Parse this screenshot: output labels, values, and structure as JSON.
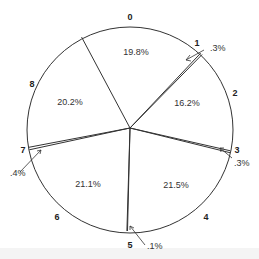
{
  "chart_data": {
    "type": "pie",
    "title": "",
    "categories": [
      "0",
      "1",
      "2",
      "3",
      "4",
      "5",
      "6",
      "7",
      "8"
    ],
    "values": [
      19.8,
      0.3,
      16.2,
      0.3,
      21.5,
      0.1,
      21.1,
      0.4,
      20.2
    ],
    "value_labels": [
      "19.8%",
      ".3%",
      "16.2%",
      ".3%",
      "21.5%",
      ".1%",
      "21.1%",
      ".4%",
      "20.2%"
    ],
    "start_angle_deg_clockwise_from_top": -28,
    "direction": "clockwise",
    "fill": "none",
    "outline_color": "#333333",
    "legend": "none (slice numbers placed outside the circle)",
    "callouts": [
      {
        "slice": "1",
        "label": ".3%"
      },
      {
        "slice": "3",
        "label": ".3%"
      },
      {
        "slice": "5",
        "label": ".1%"
      },
      {
        "slice": "7",
        "label": ".4%"
      }
    ]
  },
  "labels": {
    "slice_numbers": [
      "0",
      "1",
      "2",
      "3",
      "4",
      "5",
      "6",
      "7",
      "8"
    ],
    "pct": {
      "s0": "19.8%",
      "s1": ".3%",
      "s2": "16.2%",
      "s3": ".3%",
      "s4": "21.5%",
      "s5": ".1%",
      "s6": "21.1%",
      "s7": ".4%",
      "s8": "20.2%"
    }
  }
}
